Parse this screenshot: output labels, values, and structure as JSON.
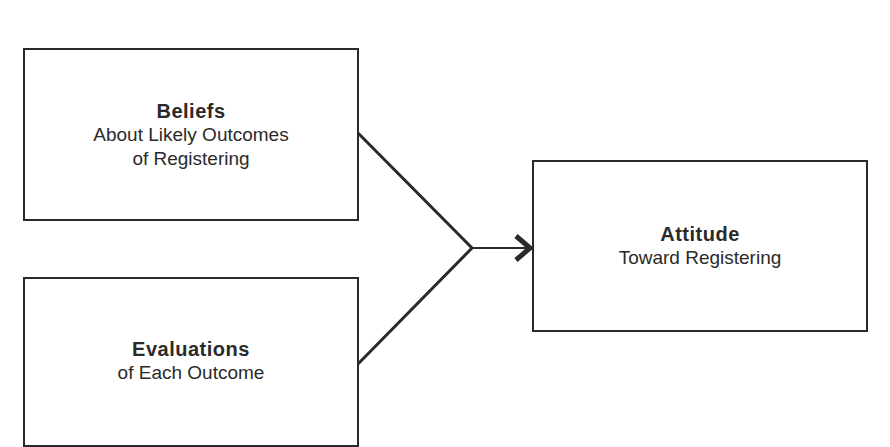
{
  "diagram": {
    "nodes": [
      {
        "id": "beliefs",
        "title": "Beliefs",
        "subtitle_line1": "About Likely Outcomes",
        "subtitle_line2": "of Registering"
      },
      {
        "id": "evaluations",
        "title": "Evaluations",
        "subtitle_line1": "of Each Outcome"
      },
      {
        "id": "attitude",
        "title": "Attitude",
        "subtitle_line1": "Toward Registering"
      }
    ],
    "edges": [
      {
        "from": "beliefs",
        "to": "attitude"
      },
      {
        "from": "evaluations",
        "to": "attitude"
      }
    ],
    "colors": {
      "stroke": "#2a2a2a",
      "background": "#ffffff"
    }
  }
}
